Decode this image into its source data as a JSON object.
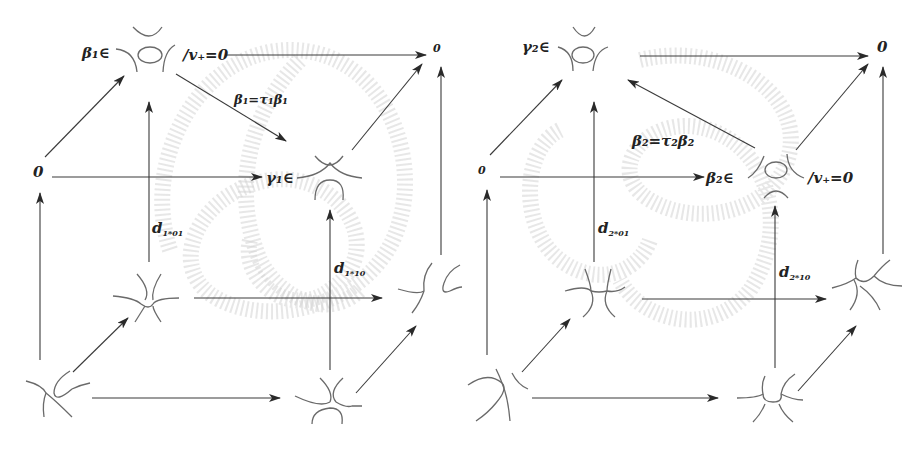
{
  "diagram": {
    "type": "commutative cube diagrams (Khovanov-type resolution cubes)",
    "left_cube": {
      "labels": {
        "top_left_prefix": "β₁∈",
        "top_left_suffix": "/v₊=0",
        "top_right": "0",
        "mid_left": "0",
        "mid_right_prefix": "γ₁∈",
        "diagonal_map": "β₁=τ₁β₁",
        "d_01": "d",
        "d_01_sub": "1*01",
        "d_10": "d",
        "d_10_sub": "1*10"
      }
    },
    "right_cube": {
      "labels": {
        "top_left_prefix": "γ₂∈",
        "top_right": "0",
        "mid_left": "0",
        "mid_right_prefix": "β₂∈",
        "mid_right_suffix": "/v₊=0",
        "diagonal_map": "β₂=τ₂β₂",
        "d_01": "d",
        "d_01_sub": "2*01",
        "d_10": "d",
        "d_10_sub": "2*10"
      }
    },
    "colors": {
      "arrow": "#3a3a3a",
      "resolution_stroke": "#6a6a6a",
      "background_knot": "#d4d4d4",
      "text": "#222222"
    }
  }
}
